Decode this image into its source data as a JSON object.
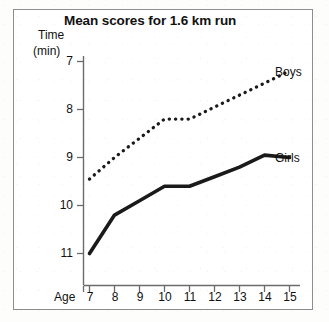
{
  "chart_data": {
    "type": "line",
    "title": "Mean scores for 1.6 km run",
    "xlabel": "Age",
    "ylabel": "Time",
    "ylabel_unit": "(min)",
    "y_inverted": true,
    "ylim": [
      7,
      11
    ],
    "xlim": [
      7,
      15
    ],
    "grid": false,
    "legend_position": "right-inline",
    "x": [
      7,
      8,
      9,
      10,
      11,
      12,
      13,
      14,
      15
    ],
    "xticklabels": [
      "7",
      "8",
      "9",
      "10",
      "11",
      "12",
      "13",
      "14",
      "15"
    ],
    "yticklabels": [
      "7",
      "8",
      "9",
      "10",
      "11"
    ],
    "yticks": [
      7,
      8,
      9,
      10,
      11
    ],
    "series": [
      {
        "name": "Boys",
        "style": "dotted",
        "color": "#1a1a1a",
        "values": [
          9.45,
          9.0,
          8.6,
          8.2,
          8.2,
          7.95,
          7.7,
          7.45,
          7.2
        ]
      },
      {
        "name": "Girls",
        "style": "solid",
        "color": "#1a1a1a",
        "values": [
          11.0,
          10.2,
          9.9,
          9.6,
          9.6,
          9.4,
          9.2,
          8.95,
          9.0
        ]
      }
    ]
  },
  "labels": {
    "title": "Mean scores for 1.6 km run",
    "y_axis_name": "Time",
    "y_axis_unit": "(min)",
    "x_axis_name": "Age",
    "boys": "Boys",
    "girls": "Girls",
    "y0": "7",
    "y1": "8",
    "y2": "9",
    "y3": "10",
    "y4": "11",
    "x0": "7",
    "x1": "8",
    "x2": "9",
    "x3": "10",
    "x4": "11",
    "x5": "12",
    "x6": "13",
    "x7": "14",
    "x8": "15"
  },
  "colors": {
    "ink": "#1a1a1a",
    "axis": "#6b6b6b",
    "frame": "#8d8d8d",
    "paper": "#ffffff"
  }
}
